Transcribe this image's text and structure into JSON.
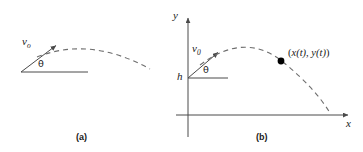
{
  "figure": {
    "width": 363,
    "height": 152,
    "background": "#ffffff",
    "stroke_color": "#4a4a4a",
    "text_color": "#1a1a1a",
    "dot_color": "#000000"
  },
  "panel_a": {
    "caption": "(a)",
    "velocity_label": "v",
    "velocity_subscript": "o",
    "angle_label": "θ",
    "description": "projectile launched from ground level",
    "launch_point": [
      22,
      72
    ],
    "arrow_tip": [
      56,
      45
    ],
    "baseline_end": [
      88,
      72
    ],
    "trajectory": {
      "start": [
        36,
        58
      ],
      "apex": [
        90,
        47
      ],
      "end": [
        150,
        69
      ]
    }
  },
  "panel_b": {
    "caption": "(b)",
    "velocity_label": "v",
    "velocity_subscript": "0",
    "angle_label": "θ",
    "height_label": "h",
    "x_axis_label": "x",
    "y_axis_label": "y",
    "point_label_open": "(",
    "point_label": "x(t), y(t)",
    "point_label_close": ")",
    "description": "projectile launched from height h with coordinate axes",
    "origin": [
      188,
      115
    ],
    "launch_point": [
      188,
      78
    ],
    "arrow_tip": [
      218,
      52
    ],
    "baseline_end": [
      228,
      78
    ],
    "trajectory": {
      "start": [
        200,
        66
      ],
      "apex": [
        243,
        45
      ],
      "end": [
        330,
        114
      ]
    },
    "marked_point": [
      281,
      61
    ]
  }
}
